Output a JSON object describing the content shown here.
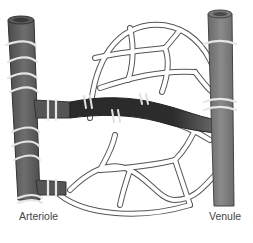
{
  "diagram": {
    "labels": {
      "arteriole": "Arteriole",
      "venule": "Venule"
    },
    "caption": "",
    "colors": {
      "vessel": "#6a6a6a",
      "vessel_dark": "#3a3a3a",
      "metarteriole": "#2e2e2e",
      "capillary_fill": "#ffffff",
      "capillary_stroke": "#555555",
      "smooth_muscle": "#e0e0e0"
    },
    "components": [
      {
        "name": "arteriole",
        "position": "left"
      },
      {
        "name": "venule",
        "position": "right"
      },
      {
        "name": "metarteriole-thoroughfare-channel",
        "position": "center"
      },
      {
        "name": "true-capillaries",
        "position": "network"
      },
      {
        "name": "precapillary-sphincters",
        "position": "capillary origins"
      }
    ]
  }
}
